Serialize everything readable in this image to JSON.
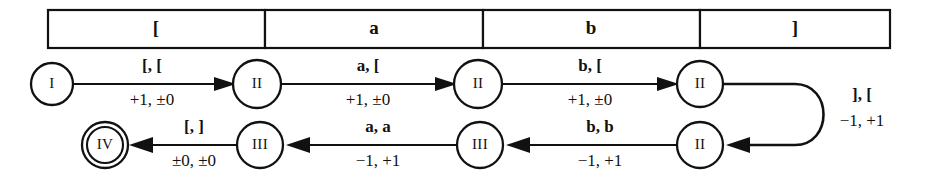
{
  "figure": {
    "kind": "turing-machine-state-diagram",
    "ink_color": "#111111",
    "background_color": "#ffffff"
  },
  "tape": {
    "cells": [
      {
        "symbol": "["
      },
      {
        "symbol": "a"
      },
      {
        "symbol": "b"
      },
      {
        "symbol": "]"
      }
    ]
  },
  "states": [
    {
      "id": "s1",
      "label": "I",
      "accepting": false
    },
    {
      "id": "s2",
      "label": "II",
      "accepting": false
    },
    {
      "id": "s3",
      "label": "II",
      "accepting": false
    },
    {
      "id": "s4",
      "label": "II",
      "accepting": false
    },
    {
      "id": "s5",
      "label": "II",
      "accepting": false
    },
    {
      "id": "s6",
      "label": "III",
      "accepting": false
    },
    {
      "id": "s7",
      "label": "III",
      "accepting": false
    },
    {
      "id": "s8",
      "label": "III",
      "accepting": false
    },
    {
      "id": "s9",
      "label": "IV",
      "accepting": true
    }
  ],
  "transitions": [
    {
      "id": "t1",
      "from": "s1",
      "to": "s2",
      "read_write": "[, [",
      "move": "+1, ±0",
      "direction": "right"
    },
    {
      "id": "t2",
      "from": "s2",
      "to": "s3",
      "read_write": "a, [",
      "move": "+1, ±0",
      "direction": "right"
    },
    {
      "id": "t3",
      "from": "s3",
      "to": "s4",
      "read_write": "b, [",
      "move": "+1, ±0",
      "direction": "right"
    },
    {
      "id": "t4",
      "from": "s4",
      "to": "s5",
      "read_write": "], [",
      "move": "−1, +1",
      "direction": "wrap"
    },
    {
      "id": "t5",
      "from": "s5",
      "to": "s6",
      "read_write": "b, b",
      "move": "−1, +1",
      "direction": "left"
    },
    {
      "id": "t6",
      "from": "s6",
      "to": "s7",
      "read_write": "a, a",
      "move": "−1, +1",
      "direction": "left"
    },
    {
      "id": "t7",
      "from": "s7",
      "to": "s8",
      "read_write": "[, ]",
      "move": "±0, ±0",
      "direction": "left"
    }
  ]
}
